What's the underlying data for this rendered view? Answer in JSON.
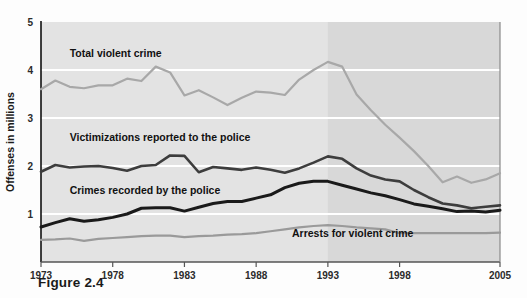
{
  "figure": {
    "caption": "Figure 2.4"
  },
  "chart_data": {
    "type": "line",
    "title": "",
    "xlabel": "",
    "ylabel": "Offenses in millions",
    "xlim": [
      1973,
      2005
    ],
    "ylim": [
      0,
      5
    ],
    "grid": true,
    "gridlines_y": [
      1,
      2,
      3,
      4
    ],
    "legend_position": "inline-annotations",
    "xtick_labels": [
      "1973",
      "1978",
      "1983",
      "1988",
      "1993",
      "1998",
      "2005"
    ],
    "xtick_values": [
      1973,
      1978,
      1983,
      1988,
      1993,
      1998,
      2005
    ],
    "ytick_labels": [
      "1",
      "2",
      "3",
      "4",
      "5"
    ],
    "ytick_values": [
      1,
      2,
      3,
      4,
      5
    ],
    "x": [
      1973,
      1974,
      1975,
      1976,
      1977,
      1978,
      1979,
      1980,
      1981,
      1982,
      1983,
      1984,
      1985,
      1986,
      1987,
      1988,
      1989,
      1990,
      1991,
      1992,
      1993,
      1994,
      1995,
      1996,
      1997,
      1998,
      1999,
      2000,
      2001,
      2002,
      2003,
      2004,
      2005
    ],
    "series": [
      {
        "name": "Total violent crime",
        "color": "#a8a8a8",
        "label_x": 1975,
        "label_y": 4.28,
        "values": [
          3.6,
          3.78,
          3.65,
          3.62,
          3.68,
          3.68,
          3.82,
          3.77,
          4.07,
          3.95,
          3.47,
          3.58,
          3.43,
          3.27,
          3.42,
          3.55,
          3.53,
          3.48,
          3.8,
          4.0,
          4.17,
          4.07,
          3.49,
          3.16,
          2.86,
          2.59,
          2.31,
          2.0,
          1.66,
          1.78,
          1.65,
          1.72,
          1.85
        ]
      },
      {
        "name": "Victimizations reported to the police",
        "color": "#3d3d3d",
        "label_x": 1975,
        "label_y": 2.52,
        "values": [
          1.88,
          2.02,
          1.97,
          1.99,
          2.0,
          1.96,
          1.9,
          2.0,
          2.02,
          2.22,
          2.21,
          1.87,
          1.98,
          1.95,
          1.92,
          1.97,
          1.92,
          1.86,
          1.95,
          2.07,
          2.2,
          2.15,
          1.95,
          1.8,
          1.72,
          1.68,
          1.5,
          1.35,
          1.22,
          1.18,
          1.12,
          1.15,
          1.18
        ]
      },
      {
        "name": "Crimes recorded by the police",
        "color": "#1a1a1a",
        "label_x": 1975,
        "label_y": 1.42,
        "values": [
          0.73,
          0.82,
          0.9,
          0.85,
          0.88,
          0.93,
          1.0,
          1.12,
          1.13,
          1.13,
          1.06,
          1.14,
          1.22,
          1.26,
          1.26,
          1.33,
          1.4,
          1.55,
          1.64,
          1.68,
          1.68,
          1.6,
          1.52,
          1.44,
          1.38,
          1.3,
          1.21,
          1.16,
          1.11,
          1.05,
          1.06,
          1.04,
          1.08
        ]
      },
      {
        "name": "Arrests for violent crime",
        "color": "#9a9a9a",
        "label_x": 1990.5,
        "label_y": 0.52,
        "values": [
          0.46,
          0.47,
          0.49,
          0.44,
          0.48,
          0.5,
          0.52,
          0.54,
          0.55,
          0.55,
          0.52,
          0.54,
          0.55,
          0.57,
          0.58,
          0.6,
          0.64,
          0.68,
          0.72,
          0.75,
          0.77,
          0.75,
          0.72,
          0.7,
          0.68,
          0.6,
          0.6,
          0.6,
          0.6,
          0.6,
          0.6,
          0.6,
          0.61
        ]
      }
    ],
    "annotations": [
      {
        "text": "Total violent crime"
      },
      {
        "text": "Victimizations reported to the police"
      },
      {
        "text": "Crimes recorded by the police"
      },
      {
        "text": "Arrests for violent crime"
      }
    ],
    "shading": {
      "plot_background": "#e3e3e3",
      "highlight_start_year": 1993,
      "highlight_background": "#d8d8d8"
    }
  }
}
